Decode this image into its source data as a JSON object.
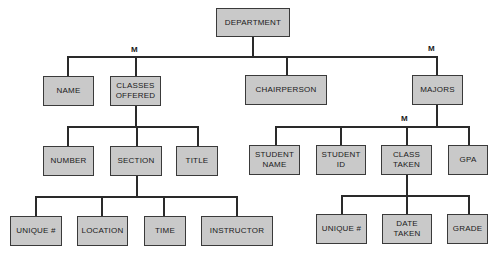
{
  "diagram": {
    "type": "hierarchy",
    "root": "DEPARTMENT",
    "multiplicity_marker": "M",
    "nodes": [
      {
        "id": "department",
        "label": "DEPARTMENT",
        "x": 216,
        "y": 8,
        "w": 74,
        "h": 29
      },
      {
        "id": "name",
        "label": "NAME",
        "x": 43,
        "y": 76,
        "w": 51,
        "h": 30
      },
      {
        "id": "classes-offered",
        "label": "CLASSES\nOFFERED",
        "x": 110,
        "y": 76,
        "w": 51,
        "h": 30
      },
      {
        "id": "chairperson",
        "label": "CHAIRPERSON",
        "x": 245,
        "y": 75,
        "w": 82,
        "h": 30
      },
      {
        "id": "majors",
        "label": "MAJORS",
        "x": 412,
        "y": 75,
        "w": 51,
        "h": 30
      },
      {
        "id": "number",
        "label": "NUMBER",
        "x": 43,
        "y": 146,
        "w": 51,
        "h": 30
      },
      {
        "id": "section",
        "label": "SECTION",
        "x": 110,
        "y": 146,
        "w": 52,
        "h": 30
      },
      {
        "id": "title",
        "label": "TITLE",
        "x": 176,
        "y": 146,
        "w": 42,
        "h": 30
      },
      {
        "id": "unique-1",
        "label": "UNIQUE #",
        "x": 10,
        "y": 216,
        "w": 52,
        "h": 30
      },
      {
        "id": "location",
        "label": "LOCATION",
        "x": 77,
        "y": 216,
        "w": 51,
        "h": 30
      },
      {
        "id": "time",
        "label": "TIME",
        "x": 144,
        "y": 216,
        "w": 42,
        "h": 30
      },
      {
        "id": "instructor",
        "label": "INSTRUCTOR",
        "x": 201,
        "y": 216,
        "w": 72,
        "h": 30
      },
      {
        "id": "student-name",
        "label": "STUDENT\nNAME",
        "x": 249,
        "y": 145,
        "w": 51,
        "h": 30
      },
      {
        "id": "student-id",
        "label": "STUDENT\nID",
        "x": 316,
        "y": 145,
        "w": 50,
        "h": 30
      },
      {
        "id": "class-taken",
        "label": "CLASS\nTAKEN",
        "x": 381,
        "y": 145,
        "w": 51,
        "h": 30
      },
      {
        "id": "gpa",
        "label": "GPA",
        "x": 448,
        "y": 145,
        "w": 40,
        "h": 30
      },
      {
        "id": "unique-2",
        "label": "UNIQUE #",
        "x": 316,
        "y": 214,
        "w": 51,
        "h": 30
      },
      {
        "id": "date-taken",
        "label": "DATE\nTAKEN",
        "x": 382,
        "y": 214,
        "w": 50,
        "h": 30
      },
      {
        "id": "grade",
        "label": "GRADE",
        "x": 447,
        "y": 214,
        "w": 41,
        "h": 30
      }
    ],
    "edges": [
      [
        "department",
        "name"
      ],
      [
        "department",
        "classes-offered"
      ],
      [
        "department",
        "chairperson"
      ],
      [
        "department",
        "majors"
      ],
      [
        "classes-offered",
        "number"
      ],
      [
        "classes-offered",
        "section"
      ],
      [
        "classes-offered",
        "title"
      ],
      [
        "section",
        "unique-1"
      ],
      [
        "section",
        "location"
      ],
      [
        "section",
        "time"
      ],
      [
        "section",
        "instructor"
      ],
      [
        "majors",
        "student-name"
      ],
      [
        "majors",
        "student-id"
      ],
      [
        "majors",
        "class-taken"
      ],
      [
        "majors",
        "gpa"
      ],
      [
        "class-taken",
        "unique-2"
      ],
      [
        "class-taken",
        "date-taken"
      ],
      [
        "class-taken",
        "grade"
      ]
    ],
    "markers": [
      {
        "label": "M",
        "x": 131,
        "y": 45,
        "applies_to": "classes-offered"
      },
      {
        "label": "M",
        "x": 428,
        "y": 44,
        "applies_to": "majors"
      },
      {
        "label": "M",
        "x": 401,
        "y": 114,
        "applies_to": "class-taken"
      }
    ],
    "lines": [
      {
        "x": 252,
        "y": 37,
        "w": 1.5,
        "h": 20
      },
      {
        "x": 67,
        "y": 56,
        "w": 370,
        "h": 1.5
      },
      {
        "x": 67,
        "y": 56,
        "w": 1.5,
        "h": 20
      },
      {
        "x": 135,
        "y": 56,
        "w": 1.5,
        "h": 20
      },
      {
        "x": 286,
        "y": 56,
        "w": 1.5,
        "h": 19
      },
      {
        "x": 436,
        "y": 56,
        "w": 1.5,
        "h": 19
      },
      {
        "x": 135,
        "y": 106,
        "w": 1.5,
        "h": 20
      },
      {
        "x": 67,
        "y": 126,
        "w": 131,
        "h": 1.5
      },
      {
        "x": 67,
        "y": 126,
        "w": 1.5,
        "h": 20
      },
      {
        "x": 197,
        "y": 126,
        "w": 1.5,
        "h": 20
      },
      {
        "x": 136,
        "y": 126,
        "w": 1.5,
        "h": 20
      },
      {
        "x": 136,
        "y": 176,
        "w": 1.5,
        "h": 20
      },
      {
        "x": 35,
        "y": 196,
        "w": 202,
        "h": 1.5
      },
      {
        "x": 35,
        "y": 196,
        "w": 1.5,
        "h": 20
      },
      {
        "x": 101,
        "y": 196,
        "w": 1.5,
        "h": 20
      },
      {
        "x": 163,
        "y": 196,
        "w": 1.5,
        "h": 20
      },
      {
        "x": 236,
        "y": 196,
        "w": 1.5,
        "h": 20
      },
      {
        "x": 436,
        "y": 105,
        "w": 1.5,
        "h": 21
      },
      {
        "x": 275,
        "y": 126,
        "w": 194,
        "h": 1.5
      },
      {
        "x": 275,
        "y": 126,
        "w": 1.5,
        "h": 19
      },
      {
        "x": 340,
        "y": 126,
        "w": 1.5,
        "h": 19
      },
      {
        "x": 406,
        "y": 126,
        "w": 1.5,
        "h": 19
      },
      {
        "x": 468,
        "y": 126,
        "w": 1.5,
        "h": 19
      },
      {
        "x": 406,
        "y": 175,
        "w": 1.5,
        "h": 20
      },
      {
        "x": 341,
        "y": 195,
        "w": 128,
        "h": 1.5
      },
      {
        "x": 341,
        "y": 195,
        "w": 1.5,
        "h": 19
      },
      {
        "x": 406,
        "y": 195,
        "w": 1.5,
        "h": 19
      },
      {
        "x": 468,
        "y": 195,
        "w": 1.5,
        "h": 19
      }
    ]
  }
}
